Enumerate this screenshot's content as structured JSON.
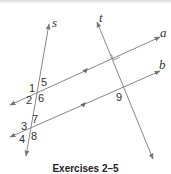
{
  "diagram": {
    "lines": [
      {
        "id": "s",
        "label": "s",
        "x1": 26,
        "y1": 156,
        "x2": 49,
        "y2": 24
      },
      {
        "id": "t",
        "label": "t",
        "x1": 97,
        "y1": 22,
        "x2": 153,
        "y2": 159
      },
      {
        "id": "a",
        "label": "a",
        "x1": 10,
        "y1": 105,
        "x2": 160,
        "y2": 37
      },
      {
        "id": "b",
        "label": "b",
        "x1": 10,
        "y1": 137,
        "x2": 160,
        "y2": 71
      }
    ],
    "angle_labels": [
      {
        "text": "1",
        "x": 29,
        "y": 92
      },
      {
        "text": "5",
        "x": 41,
        "y": 86
      },
      {
        "text": "2",
        "x": 26,
        "y": 104
      },
      {
        "text": "6",
        "x": 38,
        "y": 102
      },
      {
        "text": "3",
        "x": 21,
        "y": 130
      },
      {
        "text": "7",
        "x": 32,
        "y": 122
      },
      {
        "text": "4",
        "x": 19,
        "y": 143
      },
      {
        "text": "8",
        "x": 31,
        "y": 140
      },
      {
        "text": "9",
        "x": 117,
        "y": 100
      }
    ],
    "parallel_marks": [
      "a",
      "b"
    ],
    "right_angle_at": "t-a intersection",
    "line_color": "#888888"
  },
  "caption": "Exercises 2–5"
}
